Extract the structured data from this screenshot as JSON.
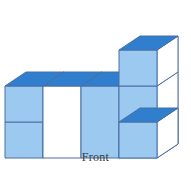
{
  "figure": {
    "caption": "Front",
    "colors": {
      "top_face": "#2f7fce",
      "front_face": "#9cc9ef",
      "side_face": "#ffffff",
      "edge": "#4a6fa5",
      "hidden_edge": "#9a9a9a",
      "background": "#ffffff",
      "label_text": "#3b3b3b"
    },
    "geometry": {
      "unit_width": 38,
      "unit_height": 36,
      "depth_dx": 21,
      "depth_dy": -14,
      "origin_x": 5,
      "origin_y": 158
    },
    "cubes": [
      {
        "name": "left-column-bottom",
        "col": 0,
        "row": 0,
        "level": 0
      },
      {
        "name": "left-column-top",
        "col": 0,
        "row": 0,
        "level": 1
      },
      {
        "name": "mid-left-base",
        "col": 1,
        "row": 0,
        "level": 0
      },
      {
        "name": "mid-right-base",
        "col": 2,
        "row": 0,
        "level": 0
      },
      {
        "name": "front-right-cube",
        "col": 3,
        "row": 0,
        "level": 0
      },
      {
        "name": "tower-bottom",
        "col": 3,
        "row": 1,
        "level": 0
      },
      {
        "name": "tower-middle",
        "col": 3,
        "row": 1,
        "level": 1
      },
      {
        "name": "tower-top",
        "col": 3,
        "row": 1,
        "level": 2
      }
    ],
    "counts": {
      "visible_cubes": 8,
      "columns": 4,
      "max_height": 3
    }
  }
}
